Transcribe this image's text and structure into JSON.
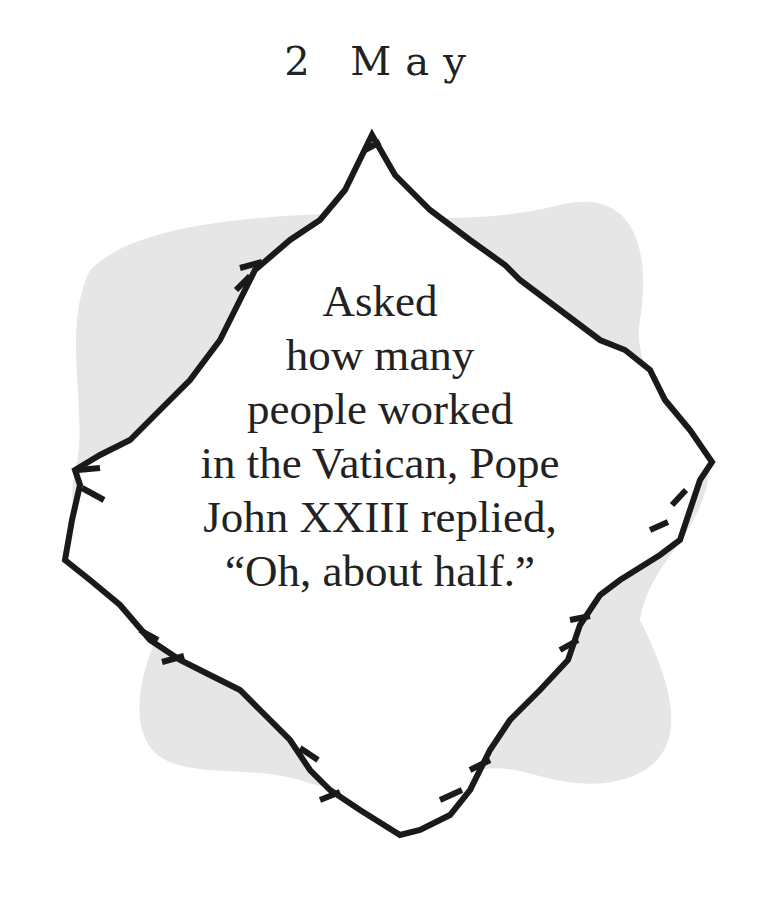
{
  "page": {
    "date": "2 May",
    "quote_lines": [
      "Asked",
      "how many",
      "people worked",
      "in the Vatican, Pope",
      "John XXIII replied,",
      "“Oh, about half.”"
    ]
  },
  "colors": {
    "background": "#ffffff",
    "blob": "#e6e6e6",
    "frame_stroke": "#1a1a1a",
    "text": "#222222"
  }
}
